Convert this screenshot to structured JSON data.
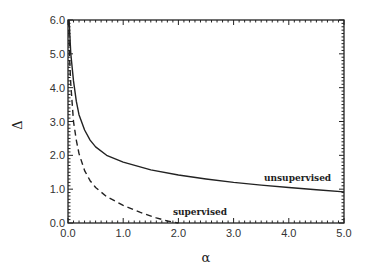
{
  "chart_data": {
    "type": "line",
    "title": "",
    "xlabel": "α",
    "ylabel": "Δ",
    "xlim": [
      0.0,
      5.0
    ],
    "ylim": [
      0.0,
      6.0
    ],
    "grid": false,
    "legend": "none (inline annotations)",
    "xticks": [
      "0.0",
      "1.0",
      "2.0",
      "3.0",
      "4.0",
      "5.0"
    ],
    "yticks": [
      "0.0",
      "1.0",
      "2.0",
      "3.0",
      "4.0",
      "5.0",
      "6.0"
    ],
    "series": [
      {
        "name": "unsupervised",
        "style": "solid",
        "x": [
          0.02,
          0.05,
          0.1,
          0.15,
          0.2,
          0.3,
          0.4,
          0.5,
          0.7,
          1.0,
          1.5,
          2.0,
          2.5,
          3.0,
          3.5,
          4.0,
          4.5,
          5.0
        ],
        "y": [
          6.0,
          5.0,
          4.2,
          3.6,
          3.2,
          2.75,
          2.45,
          2.25,
          2.0,
          1.8,
          1.57,
          1.42,
          1.3,
          1.2,
          1.12,
          1.05,
          0.98,
          0.92
        ]
      },
      {
        "name": "supervised",
        "style": "dashed",
        "x": [
          0.01,
          0.03,
          0.05,
          0.1,
          0.15,
          0.2,
          0.3,
          0.4,
          0.5,
          0.7,
          1.0,
          1.3,
          1.6,
          1.8,
          2.0
        ],
        "y": [
          6.0,
          4.8,
          4.1,
          3.0,
          2.45,
          2.05,
          1.55,
          1.25,
          1.05,
          0.78,
          0.52,
          0.32,
          0.15,
          0.06,
          0.0
        ]
      }
    ],
    "annotations": [
      {
        "text": "unsupervised",
        "x": 3.55,
        "y": 1.25
      },
      {
        "text": "supervised",
        "x": 1.9,
        "y": 0.25
      }
    ]
  }
}
